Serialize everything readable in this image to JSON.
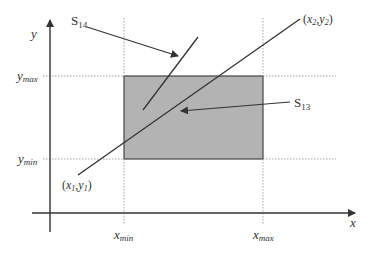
{
  "diagram": {
    "axes": {
      "x_label": "x",
      "y_label": "y"
    },
    "clip_window": {
      "x_min_label": "min",
      "x_max_label": "max",
      "y_min_label": "min",
      "y_max_label": "max",
      "fill_color": "#b3b3b3"
    },
    "segments": {
      "s13": {
        "label": "S",
        "subscript": "13"
      },
      "s14": {
        "label": "S",
        "subscript": "14"
      }
    },
    "endpoints": {
      "p1": {
        "x": "x",
        "x_sub": "1",
        "y": "y",
        "y_sub": "1"
      },
      "p2": {
        "x": "x",
        "x_sub": "2",
        "y": "y",
        "y_sub": "2"
      }
    }
  }
}
